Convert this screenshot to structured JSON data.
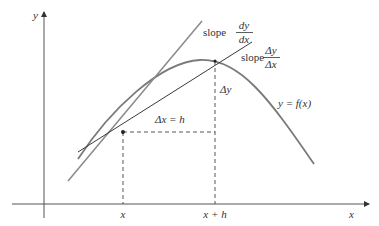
{
  "diagram": {
    "axes": {
      "x_label": "x",
      "y_label": "y"
    },
    "ticks": {
      "x_tick": "x",
      "x_plus_h_tick": "x + h"
    },
    "curve_label": "y = f(x)",
    "tangent_label": {
      "prefix": "slope",
      "numerator": "dy",
      "denominator": "dx"
    },
    "secant_label": {
      "prefix": "slope",
      "numerator": "Δy",
      "denominator": "Δx"
    },
    "delta_x_label": "Δx = h",
    "delta_y_label": "Δy",
    "colors": {
      "curve": "#7a7a7a",
      "tangent": "#8a8a8a",
      "secant": "#3a3a3a",
      "axes": "#555555",
      "text": "#333333"
    }
  }
}
